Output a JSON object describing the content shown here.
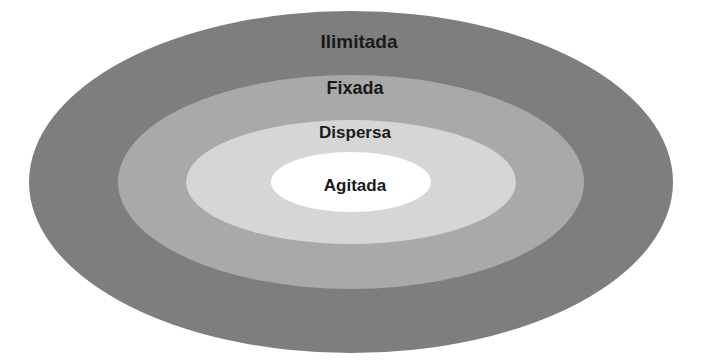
{
  "diagram": {
    "type": "concentric-ellipse-diagram",
    "background_color": "#ffffff",
    "center": {
      "x": 351,
      "y": 182
    },
    "layers": [
      {
        "id": "ilimitada",
        "label": "Ilimitada",
        "level": 1,
        "position": "outermost",
        "fill": "#7e7e7e",
        "rx": 322,
        "ry": 171,
        "label_x": 359,
        "label_y": 43,
        "label_size": 19,
        "label_color": "#1a1a1a"
      },
      {
        "id": "fixada",
        "label": "Fixada",
        "level": 2,
        "position": "second",
        "fill": "#a9a9a9",
        "rx": 233,
        "ry": 107,
        "label_x": 355,
        "label_y": 89,
        "label_size": 18,
        "label_color": "#1a1a1a"
      },
      {
        "id": "dispersa",
        "label": "Dispersa",
        "level": 3,
        "position": "third",
        "fill": "#d6d6d6",
        "rx": 165,
        "ry": 62,
        "label_x": 355,
        "label_y": 134,
        "label_size": 17,
        "label_color": "#1a1a1a"
      },
      {
        "id": "agitada",
        "label": "Agitada",
        "level": 4,
        "position": "innermost",
        "fill": "#ffffff",
        "rx": 80,
        "ry": 30,
        "label_x": 355,
        "label_y": 187,
        "label_size": 17,
        "label_color": "#1a1a1a"
      }
    ]
  }
}
